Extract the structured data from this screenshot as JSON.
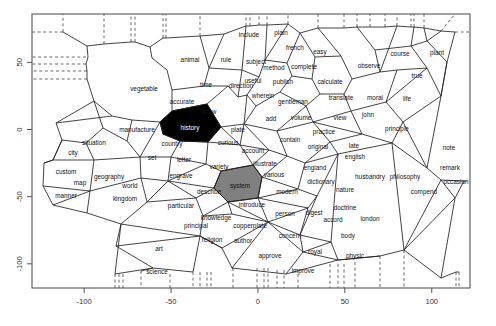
{
  "figure": {
    "title": "",
    "plot_frame": {
      "left": 32,
      "top": 14,
      "right": 470,
      "bottom": 288
    },
    "colors": {
      "frame": "#555555",
      "cell_stroke": "#222222",
      "dashed_stroke": "#444444",
      "highlight_black": "#000000",
      "highlight_gray": "#808080",
      "background": "#ffffff"
    }
  },
  "chart_data": {
    "type": "scatter",
    "title": "",
    "xlabel": "",
    "ylabel": "",
    "xlim": [
      -130,
      122
    ],
    "ylim": [
      -118,
      86
    ],
    "grid": false,
    "legend": null,
    "annotation": "Voronoi tessellation of a 2-D word map; each cell is labelled with a word. Two cells are shaded: 'history' (black) and 'system' (gray).",
    "xticks": [
      -100,
      -50,
      0,
      50,
      100
    ],
    "xticklabels": [
      "-100",
      "-50",
      "0",
      "50",
      "100"
    ],
    "yticks": [
      50,
      0,
      -50,
      -100
    ],
    "yticklabels": [
      "50",
      "0",
      "-50",
      "-100"
    ],
    "highlighted": [
      {
        "label": "history",
        "fill": "black"
      },
      {
        "label": "system",
        "fill": "gray"
      }
    ],
    "points": [
      {
        "label": "animal",
        "px": 190,
        "py": 60
      },
      {
        "label": "rule",
        "px": 226,
        "py": 60
      },
      {
        "label": "include",
        "px": 249,
        "py": 35
      },
      {
        "label": "plain",
        "px": 281,
        "py": 33
      },
      {
        "label": "subject",
        "px": 256,
        "py": 62
      },
      {
        "label": "french",
        "px": 295,
        "py": 48
      },
      {
        "label": "easy",
        "px": 320,
        "py": 52
      },
      {
        "label": "method",
        "px": 274,
        "py": 68
      },
      {
        "label": "complete",
        "px": 304,
        "py": 67
      },
      {
        "label": "observe",
        "px": 369,
        "py": 66
      },
      {
        "label": "course",
        "px": 400,
        "py": 54
      },
      {
        "label": "plant",
        "px": 437,
        "py": 53
      },
      {
        "label": "vegetable",
        "px": 144,
        "py": 89
      },
      {
        "label": "time",
        "px": 206,
        "py": 85
      },
      {
        "label": "direction",
        "px": 241,
        "py": 86
      },
      {
        "label": "useful",
        "px": 253,
        "py": 81
      },
      {
        "label": "publish",
        "px": 283,
        "py": 82
      },
      {
        "label": "calculate",
        "px": 330,
        "py": 82
      },
      {
        "label": "true",
        "px": 417,
        "py": 76
      },
      {
        "label": "accurate",
        "px": 182,
        "py": 102
      },
      {
        "label": "wherein",
        "px": 263,
        "py": 96
      },
      {
        "label": "gentleman",
        "px": 293,
        "py": 102
      },
      {
        "label": "translate",
        "px": 341,
        "py": 98
      },
      {
        "label": "moral",
        "px": 375,
        "py": 98
      },
      {
        "label": "life",
        "px": 407,
        "py": 99
      },
      {
        "label": "show",
        "px": 209,
        "py": 112
      },
      {
        "label": "add",
        "px": 271,
        "py": 119
      },
      {
        "label": "volume",
        "px": 301,
        "py": 118
      },
      {
        "label": "view",
        "px": 340,
        "py": 118
      },
      {
        "label": "john",
        "px": 368,
        "py": 115
      },
      {
        "label": "manufacture",
        "px": 137,
        "py": 130
      },
      {
        "label": "history",
        "px": 190,
        "py": 128,
        "shade": "black"
      },
      {
        "label": "plate",
        "px": 238,
        "py": 130
      },
      {
        "label": "practice",
        "px": 324,
        "py": 132
      },
      {
        "label": "principle",
        "px": 397,
        "py": 129
      },
      {
        "label": "situation",
        "px": 94,
        "py": 143
      },
      {
        "label": "country",
        "px": 172,
        "py": 144
      },
      {
        "label": "curious",
        "px": 228,
        "py": 143
      },
      {
        "label": "contain",
        "px": 290,
        "py": 140
      },
      {
        "label": "original",
        "px": 318,
        "py": 147
      },
      {
        "label": "late",
        "px": 354,
        "py": 146
      },
      {
        "label": "city",
        "px": 73,
        "py": 153
      },
      {
        "label": "account",
        "px": 253,
        "py": 151
      },
      {
        "label": "note",
        "px": 449,
        "py": 148
      },
      {
        "label": "set",
        "px": 152,
        "py": 158
      },
      {
        "label": "letter",
        "px": 184,
        "py": 160
      },
      {
        "label": "english",
        "px": 355,
        "py": 157
      },
      {
        "label": "illustrate",
        "px": 265,
        "py": 164
      },
      {
        "label": "variety",
        "px": 219,
        "py": 167
      },
      {
        "label": "custom",
        "px": 66,
        "py": 172
      },
      {
        "label": "geography",
        "px": 109,
        "py": 177
      },
      {
        "label": "engrave",
        "px": 181,
        "py": 176
      },
      {
        "label": "various",
        "px": 274,
        "py": 175
      },
      {
        "label": "england",
        "px": 315,
        "py": 168
      },
      {
        "label": "husbandry",
        "px": 370,
        "py": 177
      },
      {
        "label": "philosophy",
        "px": 405,
        "py": 177
      },
      {
        "label": "remark",
        "px": 450,
        "py": 168
      },
      {
        "label": "map",
        "px": 80,
        "py": 183
      },
      {
        "label": "world",
        "px": 130,
        "py": 186
      },
      {
        "label": "system",
        "px": 240,
        "py": 186,
        "shade": "gray"
      },
      {
        "label": "dictionary",
        "px": 321,
        "py": 182
      },
      {
        "label": "nature",
        "px": 345,
        "py": 190
      },
      {
        "label": "occasion",
        "px": 456,
        "py": 182
      },
      {
        "label": "manner",
        "px": 66,
        "py": 196
      },
      {
        "label": "kingdom",
        "px": 125,
        "py": 199
      },
      {
        "label": "describe",
        "px": 209,
        "py": 192
      },
      {
        "label": "modern",
        "px": 287,
        "py": 192
      },
      {
        "label": "compend",
        "px": 424,
        "py": 192
      },
      {
        "label": "particular",
        "px": 181,
        "py": 206
      },
      {
        "label": "introduce",
        "px": 252,
        "py": 205
      },
      {
        "label": "person",
        "px": 285,
        "py": 214
      },
      {
        "label": "digest",
        "px": 314,
        "py": 213
      },
      {
        "label": "doctrine",
        "px": 345,
        "py": 208
      },
      {
        "label": "accord",
        "px": 333,
        "py": 220
      },
      {
        "label": "london",
        "px": 370,
        "py": 219
      },
      {
        "label": "knowledge",
        "px": 216,
        "py": 218
      },
      {
        "label": "principal",
        "px": 196,
        "py": 226
      },
      {
        "label": "copperplate",
        "px": 250,
        "py": 226
      },
      {
        "label": "religion",
        "px": 212,
        "py": 240
      },
      {
        "label": "author",
        "px": 243,
        "py": 241
      },
      {
        "label": "concern",
        "px": 290,
        "py": 236
      },
      {
        "label": "body",
        "px": 348,
        "py": 236
      },
      {
        "label": "art",
        "px": 159,
        "py": 249
      },
      {
        "label": "royal",
        "px": 315,
        "py": 252
      },
      {
        "label": "approve",
        "px": 270,
        "py": 256
      },
      {
        "label": "physic",
        "px": 355,
        "py": 256
      },
      {
        "label": "improve",
        "px": 303,
        "py": 271
      },
      {
        "label": "science",
        "px": 157,
        "py": 272
      }
    ]
  },
  "edges": {
    "description": "Voronoi cell boundaries (solid) and unbounded ray stubs (dashed) of the word map."
  }
}
